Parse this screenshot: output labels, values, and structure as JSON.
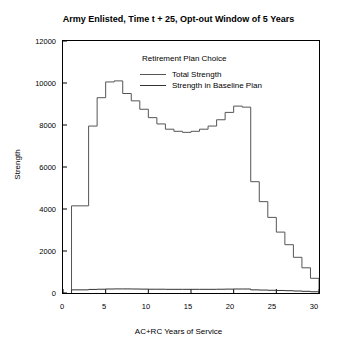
{
  "chart_data": {
    "type": "line",
    "title": "Army Enlisted, Time t + 25, Opt-out Window of 5 Years",
    "xlabel": "AC+RC Years of Service",
    "ylabel": "Strength",
    "xlim": [
      0,
      30
    ],
    "ylim": [
      0,
      12000
    ],
    "xticks": [
      0,
      5,
      10,
      15,
      20,
      25,
      30
    ],
    "yticks": [
      0,
      2000,
      4000,
      6000,
      8000,
      10000,
      12000
    ],
    "xtick_labels": [
      "0",
      "5",
      "10",
      "15",
      "20",
      "25",
      "30"
    ],
    "ytick_labels": [
      "0",
      "2000",
      "4000",
      "6000",
      "8000",
      "10000",
      "12000"
    ],
    "grid": false,
    "legend_position": "top-center-inside",
    "legend_title": "Retirement Plan Choice",
    "series": [
      {
        "name": "Total Strength",
        "color": "#555555",
        "x": [
          1,
          2,
          3,
          4,
          5,
          6,
          7,
          8,
          9,
          10,
          11,
          12,
          13,
          14,
          15,
          16,
          17,
          18,
          19,
          20,
          21,
          22,
          23,
          24,
          25,
          26,
          27,
          28,
          29
        ],
        "values": [
          4150,
          4150,
          7950,
          9300,
          10050,
          10100,
          9500,
          9150,
          8750,
          8350,
          8050,
          7800,
          7700,
          7650,
          7700,
          7800,
          7950,
          8250,
          8600,
          8900,
          8850,
          5300,
          4350,
          3600,
          2900,
          2300,
          1700,
          1200,
          700
        ]
      },
      {
        "name": "Strength in Baseline Plan",
        "color": "#333333",
        "x": [
          1,
          2,
          3,
          4,
          5,
          6,
          7,
          8,
          9,
          10,
          11,
          12,
          13,
          14,
          15,
          16,
          17,
          18,
          19,
          20,
          21,
          22,
          23,
          24,
          25,
          26,
          27,
          28,
          29
        ],
        "values": [
          150,
          150,
          170,
          180,
          190,
          195,
          195,
          190,
          185,
          180,
          180,
          175,
          175,
          175,
          175,
          175,
          175,
          180,
          185,
          190,
          190,
          150,
          140,
          130,
          120,
          110,
          95,
          80,
          60
        ]
      }
    ]
  }
}
